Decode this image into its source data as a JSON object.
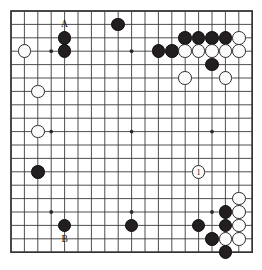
{
  "diagram": {
    "type": "go-board-problem",
    "board_size": 19,
    "grid": {
      "origin_x": 11,
      "origin_y": 11,
      "spacing": 13.4,
      "line_color": "#3b3b3b",
      "border_color": "#2b2b2b"
    },
    "star_points": [
      {
        "col": 4,
        "row": 4
      },
      {
        "col": 10,
        "row": 4
      },
      {
        "col": 16,
        "row": 4
      },
      {
        "col": 4,
        "row": 10
      },
      {
        "col": 10,
        "row": 10
      },
      {
        "col": 16,
        "row": 10
      },
      {
        "col": 4,
        "row": 16
      },
      {
        "col": 10,
        "row": 16
      },
      {
        "col": 16,
        "row": 16
      }
    ],
    "stones": [
      {
        "color": "black",
        "col": 5,
        "row": 3,
        "label": ""
      },
      {
        "color": "black",
        "col": 9,
        "row": 2,
        "label": ""
      },
      {
        "color": "white",
        "col": 2,
        "row": 4,
        "label": ""
      },
      {
        "color": "black",
        "col": 5,
        "row": 4,
        "label": ""
      },
      {
        "color": "black",
        "col": 14,
        "row": 3,
        "label": ""
      },
      {
        "color": "black",
        "col": 15,
        "row": 3,
        "label": ""
      },
      {
        "color": "black",
        "col": 16,
        "row": 3,
        "label": ""
      },
      {
        "color": "black",
        "col": 17,
        "row": 3,
        "label": ""
      },
      {
        "color": "white",
        "col": 18,
        "row": 3,
        "label": ""
      },
      {
        "color": "black",
        "col": 12,
        "row": 4,
        "label": ""
      },
      {
        "color": "black",
        "col": 13,
        "row": 4,
        "label": ""
      },
      {
        "color": "white",
        "col": 14,
        "row": 4,
        "label": ""
      },
      {
        "color": "white",
        "col": 15,
        "row": 4,
        "label": ""
      },
      {
        "color": "white",
        "col": 16,
        "row": 4,
        "label": ""
      },
      {
        "color": "white",
        "col": 17,
        "row": 4,
        "label": ""
      },
      {
        "color": "white",
        "col": 18,
        "row": 4,
        "label": ""
      },
      {
        "color": "black",
        "col": 16,
        "row": 5,
        "label": ""
      },
      {
        "color": "white",
        "col": 14,
        "row": 6,
        "label": ""
      },
      {
        "color": "white",
        "col": 17,
        "row": 6,
        "label": ""
      },
      {
        "color": "white",
        "col": 3,
        "row": 7,
        "label": ""
      },
      {
        "color": "white",
        "col": 3,
        "row": 10,
        "label": ""
      },
      {
        "color": "black",
        "col": 3,
        "row": 13,
        "label": ""
      },
      {
        "color": "white",
        "col": 15,
        "row": 13,
        "label": "1"
      },
      {
        "color": "white",
        "col": 18,
        "row": 15,
        "label": ""
      },
      {
        "color": "black",
        "col": 17,
        "row": 16,
        "label": ""
      },
      {
        "color": "white",
        "col": 18,
        "row": 16,
        "label": ""
      },
      {
        "color": "black",
        "col": 5,
        "row": 17,
        "label": ""
      },
      {
        "color": "black",
        "col": 10,
        "row": 17,
        "label": ""
      },
      {
        "color": "black",
        "col": 15,
        "row": 17,
        "label": ""
      },
      {
        "color": "black",
        "col": 17,
        "row": 17,
        "label": ""
      },
      {
        "color": "white",
        "col": 18,
        "row": 17,
        "label": ""
      },
      {
        "color": "black",
        "col": 16,
        "row": 18,
        "label": ""
      },
      {
        "color": "white",
        "col": 17,
        "row": 18,
        "label": ""
      },
      {
        "color": "white",
        "col": 18,
        "row": 18,
        "label": ""
      },
      {
        "color": "black",
        "col": 17,
        "row": 19,
        "label": ""
      }
    ],
    "point_labels": [
      {
        "text": "A",
        "col": 5,
        "row": 2
      },
      {
        "text": "B",
        "col": 5,
        "row": 18
      }
    ]
  }
}
